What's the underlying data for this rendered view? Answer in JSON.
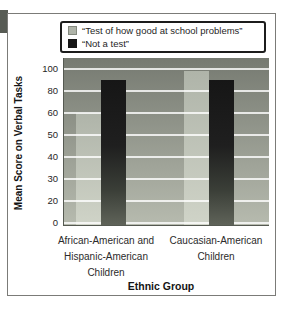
{
  "page": {
    "background": "#ffffff"
  },
  "chrome": {
    "edge_tab_color": "#575b54",
    "card_border_color": "#7b7b78",
    "legend_border_color": "#1c1c1c"
  },
  "figure": {
    "legend": {
      "items": [
        {
          "label": "“Test of how good at school problems”",
          "key": "test"
        },
        {
          "label": "“Not a test”",
          "key": "not_a_test"
        }
      ]
    }
  },
  "chart_data": {
    "type": "bar",
    "title": "",
    "categories": [
      "African-American and Hispanic-American Children",
      "Caucasian-American Children"
    ],
    "categories_lines": [
      [
        "African-American and",
        "Hispanic-American",
        "Children"
      ],
      [
        "Caucasian-American",
        "Children"
      ]
    ],
    "series": [
      {
        "name": "“Test of how good at school problems”",
        "key": "test",
        "values": [
          60,
          98
        ]
      },
      {
        "name": "“Not a test”",
        "key": "not_a_test",
        "values": [
          90,
          90
        ]
      }
    ],
    "xlabel": "Ethnic Group",
    "ylabel": "Mean Score on Verbal Tasks",
    "y_ticks": [
      100,
      80,
      60,
      50,
      40,
      30,
      20,
      0
    ],
    "y_axis_note": "Tick marks are evenly spaced although the labeled intervals are unequal (20,20,10,10,10,10,20) — a distorted scale",
    "grid": true,
    "legend_position": "top",
    "colors": {
      "plot_bg_top": "#767a71",
      "plot_bg_bottom": "#b7bbaf",
      "gridline": "rgba(255,255,255,0.8)",
      "test_bar_top": "#afb4a9",
      "test_bar_bottom": "#d0d4c8",
      "not_a_test_bar_1": "#161616",
      "not_a_test_bar_2": "#1f1f1f",
      "not_a_test_bar_3": "#3a3e37",
      "not_a_test_bar_4": "#60645a",
      "axis_line": "#555951",
      "text": "#262626"
    }
  }
}
